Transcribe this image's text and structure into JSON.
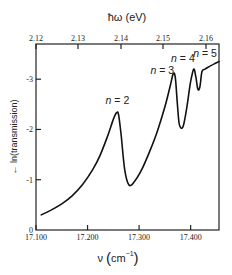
{
  "chart_data": {
    "type": "line",
    "title": "",
    "xlabel": "ν (cm⁻¹)",
    "xlabel_parts": {
      "symbol": "ν",
      "unit": "cm",
      "exp": "−1"
    },
    "x2label": "ħω (eV)",
    "ylabel": "← ln(transmission)",
    "xlim": [
      17100,
      17455
    ],
    "ylim": [
      0,
      3.7
    ],
    "x_ticks": [
      "17.100",
      "17.200",
      "17.300",
      "17.400"
    ],
    "x_tick_values": [
      17100,
      17200,
      17300,
      17400
    ],
    "x2_ticks": [
      "2.12",
      "2.13",
      "2.14",
      "2.15",
      "2.16"
    ],
    "y_ticks": [
      "0",
      "-1",
      "-2",
      "-3"
    ],
    "y_tick_values": [
      0,
      1,
      2,
      3
    ],
    "grid": false,
    "legend": null,
    "series": [
      {
        "name": "ln(transmission)",
        "x": [
          17110,
          17130,
          17150,
          17170,
          17190,
          17210,
          17225,
          17240,
          17250,
          17256,
          17260,
          17265,
          17272,
          17280,
          17290,
          17305,
          17320,
          17335,
          17350,
          17360,
          17366,
          17370,
          17374,
          17378,
          17385,
          17392,
          17400,
          17406,
          17410,
          17414,
          17418,
          17422,
          17428,
          17436,
          17445,
          17455
        ],
        "y": [
          0.3,
          0.4,
          0.52,
          0.68,
          0.9,
          1.2,
          1.5,
          1.9,
          2.2,
          2.33,
          2.3,
          1.9,
          1.2,
          0.9,
          0.95,
          1.2,
          1.55,
          1.95,
          2.45,
          2.85,
          3.1,
          3.05,
          2.55,
          2.1,
          2.05,
          2.4,
          2.95,
          3.2,
          3.05,
          2.8,
          2.85,
          3.15,
          3.2,
          3.25,
          3.3,
          3.35
        ]
      }
    ],
    "annotations": [
      {
        "text": "n = 2",
        "x": 17258,
        "y": 2.5
      },
      {
        "text": "n = 3",
        "x": 17345,
        "y": 3.1
      },
      {
        "text": "n = 4",
        "x": 17385,
        "y": 3.35
      },
      {
        "text": "n = 5",
        "x": 17428,
        "y": 3.45
      }
    ]
  }
}
